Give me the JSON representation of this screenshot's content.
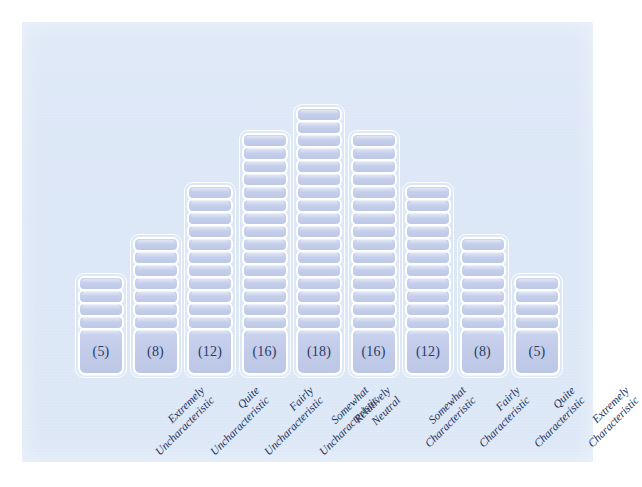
{
  "figure": {
    "type": "q-sort-distribution",
    "background_color": "#ffffff",
    "panel_color": "#dce8f7",
    "cell_fill_color": "#c4ceea",
    "cell_border_color": "#ffffff",
    "text_color": "#21305c"
  },
  "chart_data": {
    "type": "bar",
    "title": "",
    "subtitle": "",
    "xlabel": "",
    "ylabel": "",
    "categories": [
      "Extremely Uncharacteristic",
      "Quite Uncharacteristic",
      "Fairly Uncharacteristic",
      "Somewhat Uncharacteristic",
      "Relatively Neutral",
      "Somewhat Characteristic",
      "Fairly Characteristic",
      "Quite Characteristic",
      "Extremely Characteristic"
    ],
    "values": [
      5,
      8,
      12,
      16,
      18,
      16,
      12,
      8,
      5
    ],
    "value_labels": [
      "(5)",
      "(8)",
      "(12)",
      "(16)",
      "(18)",
      "(16)",
      "(12)",
      "(8)",
      "(5)"
    ],
    "total": 100,
    "ylim": [
      0,
      18
    ],
    "grid": false,
    "legend": null,
    "annotations": []
  },
  "columns": [
    {
      "id": "col-1",
      "value": 5,
      "value_label": "(5)",
      "label_line1": "Extremely",
      "label_line2": "Uncharacteristic"
    },
    {
      "id": "col-2",
      "value": 8,
      "value_label": "(8)",
      "label_line1": "Quite",
      "label_line2": "Uncharacteristic"
    },
    {
      "id": "col-3",
      "value": 12,
      "value_label": "(12)",
      "label_line1": "Fairly",
      "label_line2": "Uncharacteristic"
    },
    {
      "id": "col-4",
      "value": 16,
      "value_label": "(16)",
      "label_line1": "Somewhat",
      "label_line2": "Uncharacteristic"
    },
    {
      "id": "col-5",
      "value": 18,
      "value_label": "(18)",
      "label_line1": "Relatively",
      "label_line2": "Neutral"
    },
    {
      "id": "col-6",
      "value": 16,
      "value_label": "(16)",
      "label_line1": "Somewhat",
      "label_line2": "Characteristic"
    },
    {
      "id": "col-7",
      "value": 12,
      "value_label": "(12)",
      "label_line1": "Fairly",
      "label_line2": "Characteristic"
    },
    {
      "id": "col-8",
      "value": 8,
      "value_label": "(8)",
      "label_line1": "Quite",
      "label_line2": "Characteristic"
    },
    {
      "id": "col-9",
      "value": 5,
      "value_label": "(5)",
      "label_line1": "Extremely",
      "label_line2": "Characteristic"
    }
  ]
}
